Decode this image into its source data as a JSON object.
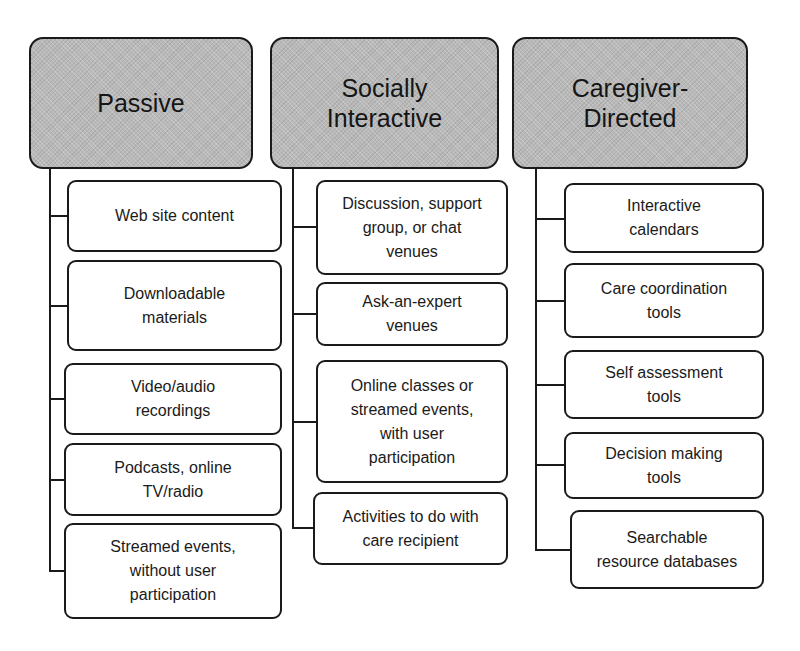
{
  "diagram": {
    "columns": [
      {
        "title": "Passive",
        "items": [
          "Web site content",
          "Downloadable\nmaterials",
          "Video/audio\nrecordings",
          "Podcasts, online\nTV/radio",
          "Streamed events,\nwithout user\nparticipation"
        ]
      },
      {
        "title": "Socially\nInteractive",
        "items": [
          "Discussion, support\ngroup, or chat\nvenues",
          "Ask-an-expert\nvenues",
          "Online classes or\nstreamed events,\nwith user\nparticipation",
          "Activities to do with\ncare recipient"
        ]
      },
      {
        "title": "Caregiver-\nDirected",
        "items": [
          "Interactive\ncalendars",
          "Care coordination\ntools",
          "Self assessment\ntools",
          "Decision making\ntools",
          "Searchable\nresource databases"
        ]
      }
    ],
    "colors": {
      "header_fill": "#b9b9b9",
      "border": "#1a1a1a",
      "item_fill": "#ffffff"
    }
  }
}
